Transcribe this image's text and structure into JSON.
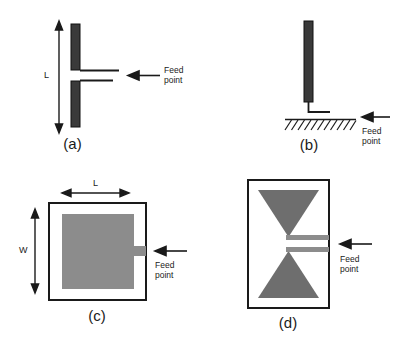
{
  "figure": {
    "background_color": "#ffffff",
    "ink_color": "#1a1a1a",
    "dark_metal_color": "#3a3a3a",
    "gray_metal_color": "#8c8c8c",
    "panels": [
      {
        "id": "a",
        "caption": "(a)",
        "antenna_type": "dipole",
        "dimension_labels": [
          "L"
        ],
        "feed_label_lines": [
          "Feed",
          "point"
        ]
      },
      {
        "id": "b",
        "caption": "(b)",
        "antenna_type": "monopole-over-ground-plane",
        "dimension_labels": [],
        "feed_label_lines": [
          "Feed",
          "point"
        ],
        "ground_plane_hatch_count": 11
      },
      {
        "id": "c",
        "caption": "(c)",
        "antenna_type": "rectangular-microstrip-patch",
        "dimension_labels": [
          "L",
          "W"
        ],
        "feed_label_lines": [
          "Feed",
          "point"
        ]
      },
      {
        "id": "d",
        "caption": "(d)",
        "antenna_type": "bowtie",
        "dimension_labels": [],
        "feed_label_lines": [
          "Feed",
          "point"
        ]
      }
    ]
  }
}
